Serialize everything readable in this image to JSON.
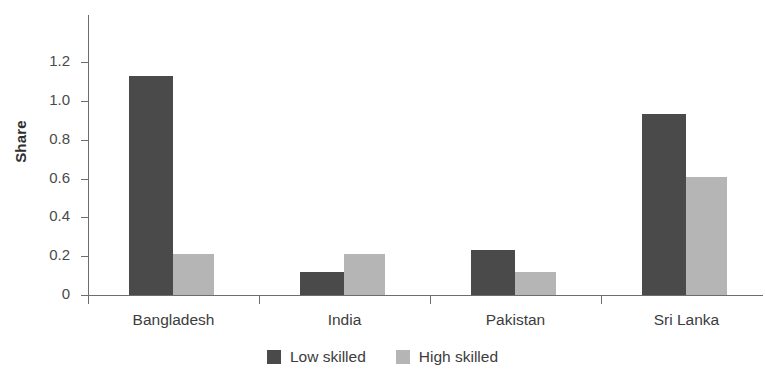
{
  "chart_data": {
    "type": "bar",
    "title": "",
    "subtitle": "",
    "xlabel": "",
    "ylabel": "Share",
    "categories": [
      "Bangladesh",
      "India",
      "Pakistan",
      "Sri Lanka"
    ],
    "series": [
      {
        "name": "Low skilled",
        "color": "#4a4a4a",
        "values": [
          1.13,
          0.12,
          0.23,
          0.93
        ]
      },
      {
        "name": "High skilled",
        "color": "#b5b5b5",
        "values": [
          0.21,
          0.21,
          0.12,
          0.61
        ]
      }
    ],
    "ylim": [
      0,
      1.2
    ],
    "ytick_labels": [
      "0",
      "0.2",
      "0.4",
      "0.6",
      "0.8",
      "1.0",
      "1.2"
    ],
    "ytick_values": [
      0,
      0.2,
      0.4,
      0.6,
      0.8,
      1.0,
      1.2
    ],
    "grid": false,
    "legend_position": "bottom-center"
  },
  "axis": {
    "y_title": "Share"
  },
  "legend": {
    "items": [
      {
        "label": "Low skilled",
        "color": "#4a4a4a"
      },
      {
        "label": "High skilled",
        "color": "#b5b5b5"
      }
    ]
  }
}
